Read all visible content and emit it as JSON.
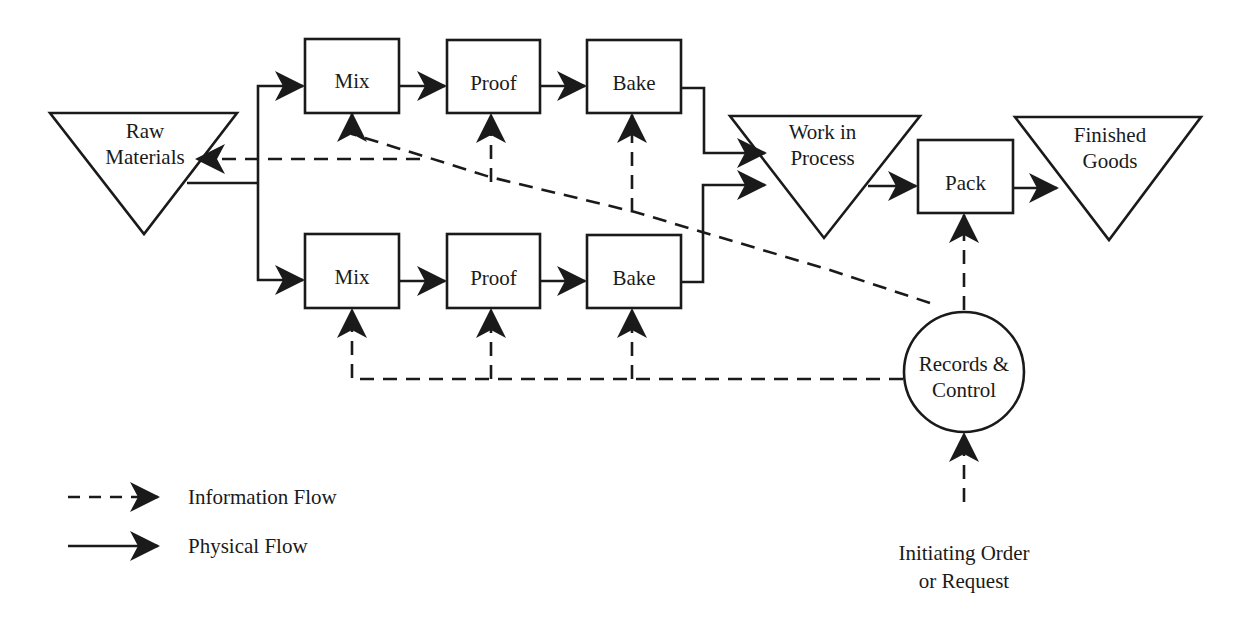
{
  "diagram": {
    "type": "process-flow",
    "nodes": {
      "raw_materials": {
        "line1": "Raw",
        "line2": "Materials",
        "shape": "inverted-triangle"
      },
      "mix_top": {
        "label": "Mix",
        "shape": "rectangle"
      },
      "proof_top": {
        "label": "Proof",
        "shape": "rectangle"
      },
      "bake_top": {
        "label": "Bake",
        "shape": "rectangle"
      },
      "mix_bottom": {
        "label": "Mix",
        "shape": "rectangle"
      },
      "proof_bottom": {
        "label": "Proof",
        "shape": "rectangle"
      },
      "bake_bottom": {
        "label": "Bake",
        "shape": "rectangle"
      },
      "work_in_process": {
        "line1": "Work in",
        "line2": "Process",
        "shape": "inverted-triangle"
      },
      "pack": {
        "label": "Pack",
        "shape": "rectangle"
      },
      "finished_goods": {
        "line1": "Finished",
        "line2": "Goods",
        "shape": "inverted-triangle"
      },
      "records_control": {
        "line1": "Records &",
        "line2": "Control",
        "shape": "circle"
      },
      "initiating_order": {
        "line1": "Initiating Order",
        "line2": "or Request",
        "shape": "text"
      }
    },
    "edges": [
      {
        "from": "raw_materials",
        "to": "mix_top",
        "type": "physical"
      },
      {
        "from": "raw_materials",
        "to": "mix_bottom",
        "type": "physical"
      },
      {
        "from": "mix_top",
        "to": "proof_top",
        "type": "physical"
      },
      {
        "from": "proof_top",
        "to": "bake_top",
        "type": "physical"
      },
      {
        "from": "mix_bottom",
        "to": "proof_bottom",
        "type": "physical"
      },
      {
        "from": "proof_bottom",
        "to": "bake_bottom",
        "type": "physical"
      },
      {
        "from": "bake_top",
        "to": "work_in_process",
        "type": "physical"
      },
      {
        "from": "bake_bottom",
        "to": "work_in_process",
        "type": "physical"
      },
      {
        "from": "work_in_process",
        "to": "pack",
        "type": "physical"
      },
      {
        "from": "pack",
        "to": "finished_goods",
        "type": "physical"
      },
      {
        "from": "records_control",
        "to": "pack",
        "type": "information"
      },
      {
        "from": "records_control",
        "to": "mix_top",
        "type": "information"
      },
      {
        "from": "records_control",
        "to": "proof_top",
        "type": "information"
      },
      {
        "from": "records_control",
        "to": "bake_top",
        "type": "information"
      },
      {
        "from": "records_control",
        "to": "raw_materials",
        "type": "information"
      },
      {
        "from": "records_control",
        "to": "mix_bottom",
        "type": "information"
      },
      {
        "from": "records_control",
        "to": "proof_bottom",
        "type": "information"
      },
      {
        "from": "records_control",
        "to": "bake_bottom",
        "type": "information"
      },
      {
        "from": "initiating_order",
        "to": "records_control",
        "type": "information"
      }
    ]
  },
  "legend": {
    "information_flow": "Information Flow",
    "physical_flow": "Physical Flow"
  },
  "colors": {
    "stroke": "#1a1a1a",
    "background": "#ffffff"
  }
}
